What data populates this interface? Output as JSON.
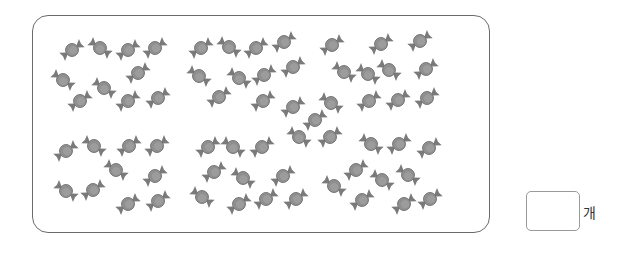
{
  "problem": {
    "unit_label": "개",
    "answer_value": ""
  },
  "candy_icon": "wrapped-candy-icon",
  "colors": {
    "frame_border": "#6b6b6b",
    "candy_body": "#8f8f8f",
    "candy_highlight": "#a8a8a8",
    "candy_wrapper": "#7a7a7a"
  },
  "candies": [
    {
      "x": 72,
      "y": 50,
      "r": -35
    },
    {
      "x": 100,
      "y": 48,
      "r": 35
    },
    {
      "x": 128,
      "y": 50,
      "r": -35
    },
    {
      "x": 155,
      "y": 48,
      "r": -35
    },
    {
      "x": 63,
      "y": 80,
      "r": 35
    },
    {
      "x": 104,
      "y": 88,
      "r": 35
    },
    {
      "x": 138,
      "y": 73,
      "r": -35
    },
    {
      "x": 80,
      "y": 101,
      "r": -35
    },
    {
      "x": 128,
      "y": 101,
      "r": -35
    },
    {
      "x": 158,
      "y": 98,
      "r": -35
    },
    {
      "x": 201,
      "y": 48,
      "r": -35
    },
    {
      "x": 229,
      "y": 47,
      "r": 35
    },
    {
      "x": 256,
      "y": 48,
      "r": -35
    },
    {
      "x": 284,
      "y": 42,
      "r": -35
    },
    {
      "x": 199,
      "y": 76,
      "r": 35
    },
    {
      "x": 239,
      "y": 78,
      "r": 35
    },
    {
      "x": 264,
      "y": 75,
      "r": -35
    },
    {
      "x": 293,
      "y": 67,
      "r": -35
    },
    {
      "x": 219,
      "y": 97,
      "r": -35
    },
    {
      "x": 263,
      "y": 101,
      "r": -35
    },
    {
      "x": 293,
      "y": 107,
      "r": -35
    },
    {
      "x": 332,
      "y": 45,
      "r": -35
    },
    {
      "x": 381,
      "y": 44,
      "r": -35
    },
    {
      "x": 420,
      "y": 41,
      "r": -35
    },
    {
      "x": 344,
      "y": 72,
      "r": 35
    },
    {
      "x": 368,
      "y": 74,
      "r": 35
    },
    {
      "x": 389,
      "y": 70,
      "r": 35
    },
    {
      "x": 426,
      "y": 69,
      "r": -35
    },
    {
      "x": 331,
      "y": 103,
      "r": 35
    },
    {
      "x": 369,
      "y": 101,
      "r": -35
    },
    {
      "x": 398,
      "y": 100,
      "r": -35
    },
    {
      "x": 427,
      "y": 98,
      "r": -35
    },
    {
      "x": 315,
      "y": 120,
      "r": -35
    },
    {
      "x": 66,
      "y": 151,
      "r": -35
    },
    {
      "x": 94,
      "y": 146,
      "r": 35
    },
    {
      "x": 129,
      "y": 146,
      "r": -35
    },
    {
      "x": 157,
      "y": 146,
      "r": -35
    },
    {
      "x": 116,
      "y": 170,
      "r": 35
    },
    {
      "x": 155,
      "y": 176,
      "r": -35
    },
    {
      "x": 66,
      "y": 191,
      "r": 35
    },
    {
      "x": 93,
      "y": 190,
      "r": -35
    },
    {
      "x": 128,
      "y": 204,
      "r": -35
    },
    {
      "x": 158,
      "y": 201,
      "r": -35
    },
    {
      "x": 208,
      "y": 147,
      "r": -35
    },
    {
      "x": 233,
      "y": 147,
      "r": 35
    },
    {
      "x": 262,
      "y": 147,
      "r": -35
    },
    {
      "x": 214,
      "y": 172,
      "r": -35
    },
    {
      "x": 243,
      "y": 178,
      "r": 35
    },
    {
      "x": 283,
      "y": 176,
      "r": -35
    },
    {
      "x": 202,
      "y": 197,
      "r": 35
    },
    {
      "x": 239,
      "y": 204,
      "r": -35
    },
    {
      "x": 266,
      "y": 199,
      "r": -35
    },
    {
      "x": 296,
      "y": 199,
      "r": -35
    },
    {
      "x": 299,
      "y": 137,
      "r": 35
    },
    {
      "x": 330,
      "y": 137,
      "r": -35
    },
    {
      "x": 371,
      "y": 144,
      "r": 35
    },
    {
      "x": 399,
      "y": 144,
      "r": -35
    },
    {
      "x": 429,
      "y": 148,
      "r": -35
    },
    {
      "x": 356,
      "y": 170,
      "r": -35
    },
    {
      "x": 382,
      "y": 180,
      "r": 35
    },
    {
      "x": 408,
      "y": 175,
      "r": 35
    },
    {
      "x": 334,
      "y": 186,
      "r": 35
    },
    {
      "x": 362,
      "y": 200,
      "r": -35
    },
    {
      "x": 404,
      "y": 204,
      "r": -35
    },
    {
      "x": 430,
      "y": 199,
      "r": -35
    }
  ]
}
